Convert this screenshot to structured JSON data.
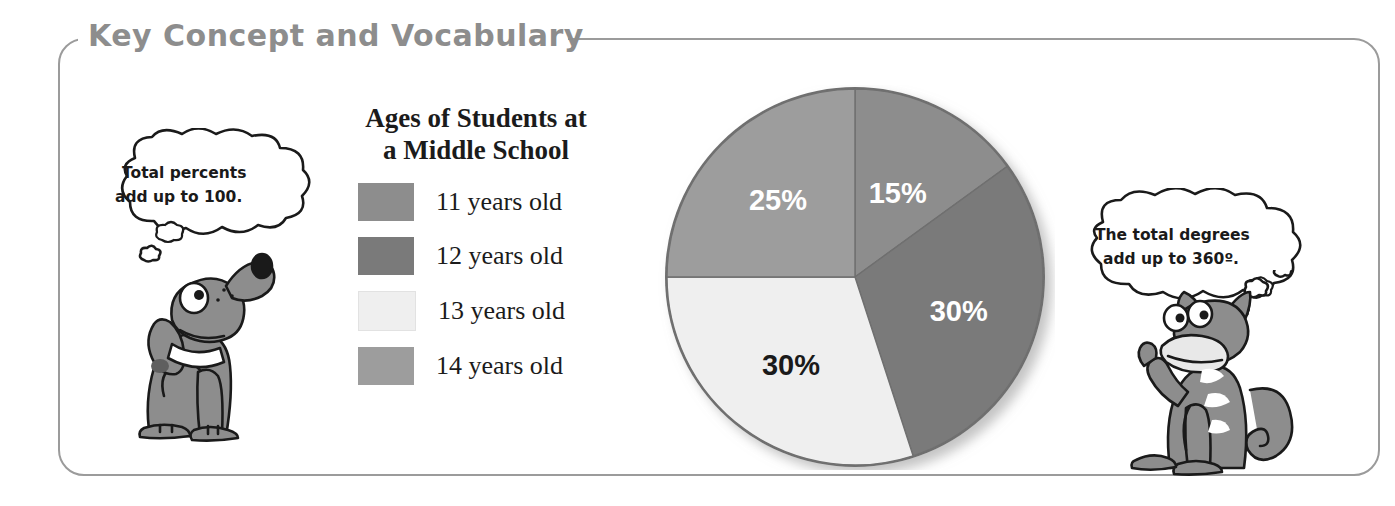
{
  "panel": {
    "title": "Key Concept and Vocabulary",
    "border_color": "#9b9b9b",
    "title_color": "#8d8d8d"
  },
  "legend": {
    "title_line1": "Ages of Students at",
    "title_line2": "a Middle School",
    "items": [
      {
        "label": "11 years old",
        "color": "#8d8d8d"
      },
      {
        "label": "12 years old",
        "color": "#7a7a7a"
      },
      {
        "label": "13 years old",
        "color": "#efefef"
      },
      {
        "label": "14 years old",
        "color": "#9d9d9d"
      }
    ]
  },
  "bubbles": {
    "left": {
      "line1": "Total percents",
      "line2": "add up to 100."
    },
    "right": {
      "line1": "The total degrees",
      "line2": "add up to 360º."
    }
  },
  "characters": {
    "left": "dog-illustration",
    "right": "cat-illustration"
  },
  "chart_data": {
    "type": "pie",
    "title": "Ages of Students at a Middle School",
    "categories": [
      "11 years old",
      "12 years old",
      "13 years old",
      "14 years old"
    ],
    "values": [
      15,
      30,
      30,
      25
    ],
    "value_labels": [
      "15%",
      "30%",
      "30%",
      "25%"
    ],
    "colors": [
      "#8d8d8d",
      "#7a7a7a",
      "#efefef",
      "#9d9d9d"
    ],
    "label_colors": [
      "#ffffff",
      "#ffffff",
      "#1a1a1a",
      "#ffffff"
    ],
    "start_angle_deg": 0,
    "direction": "clockwise",
    "units": "percent",
    "total": 100,
    "legend_position": "left"
  }
}
